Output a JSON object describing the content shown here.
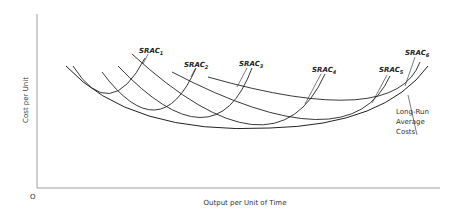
{
  "chart_data": {
    "type": "line",
    "title": "",
    "xlabel": "Output per Unit of Time",
    "ylabel": "Cost per Unit",
    "origin_label": "O",
    "grid": false,
    "series": [
      {
        "name": "SRAC1",
        "label_main": "SRAC",
        "label_sub": "1",
        "path": "M73,66 Q110,125 145,58"
      },
      {
        "name": "SRAC2",
        "label_main": "SRAC",
        "label_sub": "2",
        "path": "M102,72 Q160,150 196,68"
      },
      {
        "name": "SRAC3",
        "label_main": "SRAC",
        "label_sub": "3",
        "path": "M118,66 Q215,168 252,68"
      },
      {
        "name": "SRAC4",
        "label_main": "SRAC",
        "label_sub": "4",
        "path": "M132,54 Q275,185 325,74"
      },
      {
        "name": "SRAC5",
        "label_main": "SRAC",
        "label_sub": "5",
        "path": "M172,72 Q350,165 390,76"
      },
      {
        "name": "SRAC6",
        "label_main": "SRAC",
        "label_sub": "6",
        "path": "M208,77 Q395,130 420,62"
      },
      {
        "name": "Long-Run Average Costs",
        "path": "M66,66 Q130,135 270,128 Q385,125 428,66"
      }
    ],
    "annotations": [
      {
        "text_lines": [
          "Long-Run",
          "Average",
          "Costs"
        ],
        "points_to": "LRAC curve"
      }
    ]
  }
}
